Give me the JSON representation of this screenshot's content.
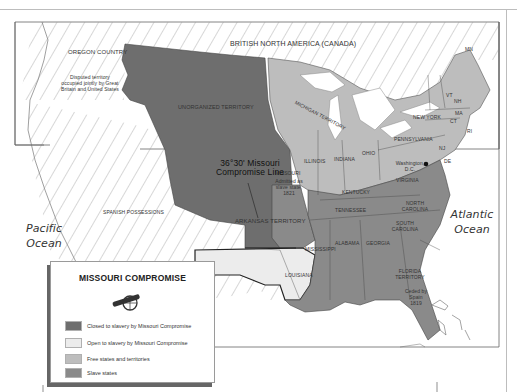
{
  "map": {
    "regions": {
      "oregon": {
        "name": "OREGON\nCOUNTRY",
        "note": "Disputed territory occupied jointly by Great Britain and United States"
      },
      "canada": "BRITISH NORTH AMERICA (CANADA)",
      "unorganized": "UNORGANIZED TERRITORY",
      "michigan": "MICHIGAN TERRITORY",
      "spanish": "SPANISH POSSESSIONS",
      "arkansas": "ARKANSAS TERRITORY",
      "missouri": {
        "name": "MISSOURI",
        "note": "Admitted as slave state, 1821"
      },
      "florida": {
        "name": "FLORIDA TERRITORY",
        "note": "Ceded by Spain 1819"
      },
      "washington_dc": "Washington, D.C."
    },
    "states": [
      "MN",
      "VT",
      "NH",
      "MA",
      "CT",
      "RI",
      "NJ",
      "DE",
      "MD",
      "NEW YORK",
      "PENNSYLVANIA",
      "OHIO",
      "INDIANA",
      "ILLINOIS",
      "KENTUCKY",
      "VIRGINIA",
      "NORTH CAROLINA",
      "TENNESSEE",
      "SOUTH CAROLINA",
      "GEORGIA",
      "ALABAMA",
      "MISSISSIPPI",
      "LOUISIANA"
    ],
    "oceans": {
      "pacific": "Pacific Ocean",
      "atlantic": "Atlantic Ocean"
    },
    "compromise_line": "36°30' Missouri Compromise Line"
  },
  "legend": {
    "title": "MISSOURI COMPROMISE",
    "icon": "cannon-icon",
    "items": [
      {
        "label": "Closed to slavery by Missouri Compromise",
        "color": "#6e6e6e"
      },
      {
        "label": "Open to slavery by Missouri Compromise",
        "color": "#ececec"
      },
      {
        "label": "Free states and territories",
        "color": "#bdbdbd"
      },
      {
        "label": "Slave states",
        "color": "#8a8a8a"
      }
    ]
  },
  "colors": {
    "closed": "#6e6e6e",
    "open": "#ececec",
    "free": "#bdbdbd",
    "slave": "#8a8a8a",
    "hatch": "#999999",
    "border": "#555555"
  }
}
